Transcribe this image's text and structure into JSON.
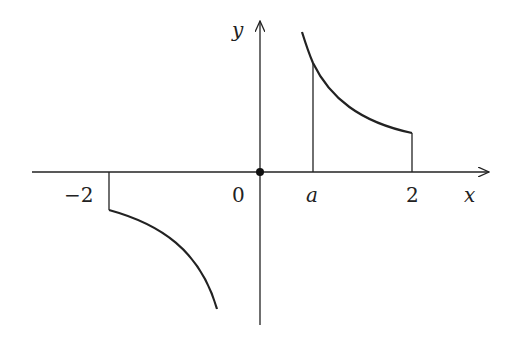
{
  "diagram": {
    "type": "function-graph",
    "axes": {
      "x_label": "x",
      "y_label": "y"
    },
    "tick_labels": {
      "neg_two": "−2",
      "zero": "0",
      "a": "a",
      "two": "2"
    },
    "origin_point": "filled-dot",
    "curves": [
      {
        "name": "positive-branch",
        "domain": "x > 0 (near 0 to 2)",
        "shape": "decreasing hyperbola-like, above x-axis"
      },
      {
        "name": "negative-branch",
        "domain": "-2 to near 0",
        "shape": "decreasing hyperbola-like, below x-axis"
      }
    ],
    "shaded_region": "area under curve from x=a to x=2 bounded by vertical lines",
    "colors": {
      "stroke": "#222222",
      "background": "#ffffff"
    }
  }
}
